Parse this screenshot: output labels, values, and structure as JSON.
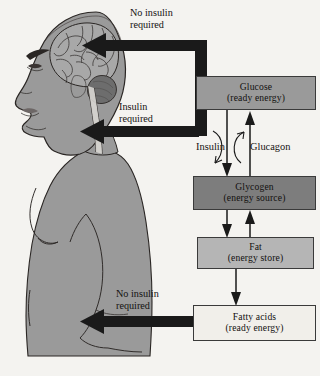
{
  "figure": {
    "background_color": "#f4f3f0",
    "arrow_color": "#1a1a1a",
    "text_color": "#141210"
  },
  "body_figure": {
    "name": "human-profile-figure",
    "skin_color": "#9a9a9a",
    "outline_color": "#2a2624",
    "brain_label": "brain",
    "parts": [
      "head-profile",
      "brain",
      "cerebellum",
      "brain-stem",
      "torso",
      "arm"
    ]
  },
  "nodes": [
    {
      "id": "glucose",
      "line1": "Glucose",
      "line2": "(ready energy)",
      "fill": "#9a9a9a"
    },
    {
      "id": "glycogen",
      "line1": "Glycogen",
      "line2": "(energy source)",
      "fill": "#7d7d7d"
    },
    {
      "id": "fat",
      "line1": "Fat",
      "line2": "(energy store)",
      "fill": "#b5b5b5"
    },
    {
      "id": "fatty_acids",
      "line1": "Fatty acids",
      "line2": "(ready energy)",
      "fill": "#f1efea"
    }
  ],
  "labels": {
    "no_insulin_top_line1": "No insulin",
    "no_insulin_top_line2": "required",
    "insulin_required_line1": "Insulin",
    "insulin_required_line2": "required",
    "no_insulin_bottom_line1": "No insulin",
    "no_insulin_bottom_line2": "required",
    "insulin": "Insulin",
    "glucagon": "Glucagon"
  },
  "connections": [
    {
      "id": "glucose-to-brain",
      "from": "glucose",
      "to": "brain",
      "label": "No insulin required",
      "style": "thick-black-bracket-arrow"
    },
    {
      "id": "glucose-to-body",
      "from": "glucose",
      "to": "body",
      "label": "Insulin required",
      "style": "thick-black-bracket-arrow"
    },
    {
      "id": "glucose-to-glycogen",
      "from": "glucose",
      "to": "glycogen",
      "label": "Insulin",
      "style": "thin-down-arrow"
    },
    {
      "id": "glycogen-to-glucose",
      "from": "glycogen",
      "to": "glucose",
      "label": "Glucagon",
      "style": "thin-up-arrow"
    },
    {
      "id": "glycogen-to-fat",
      "from": "glycogen",
      "to": "fat",
      "label": "",
      "style": "thin-down-arrow"
    },
    {
      "id": "fat-to-glycogen",
      "from": "fat",
      "to": "glycogen",
      "label": "",
      "style": "thin-up-arrow"
    },
    {
      "id": "fat-to-fatty-acids",
      "from": "fat",
      "to": "fatty_acids",
      "label": "",
      "style": "thin-down-arrow"
    },
    {
      "id": "fatty-acids-to-body",
      "from": "fatty_acids",
      "to": "body",
      "label": "No insulin required",
      "style": "thick-black-arrow"
    }
  ]
}
